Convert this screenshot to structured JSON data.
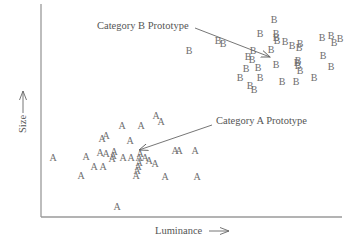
{
  "chart_data": {
    "type": "scatter",
    "title": "",
    "xlabel": "Luminance",
    "ylabel": "Size",
    "grid": false,
    "legend": null,
    "axes": {
      "x_ticks": [],
      "y_ticks": []
    },
    "series": [
      {
        "name": "Category A",
        "marker": "A",
        "points_px": [
          [
            156,
            115
          ],
          [
            161,
            121
          ],
          [
            122,
            125
          ],
          [
            141,
            125
          ],
          [
            102,
            138
          ],
          [
            106,
            135
          ],
          [
            130,
            140
          ],
          [
            53,
            157
          ],
          [
            86,
            156
          ],
          [
            94,
            166
          ],
          [
            103,
            166
          ],
          [
            100,
            152
          ],
          [
            106,
            153
          ],
          [
            113,
            155
          ],
          [
            114,
            151
          ],
          [
            112,
            158
          ],
          [
            123,
            157
          ],
          [
            131,
            157
          ],
          [
            139,
            157
          ],
          [
            140,
            153
          ],
          [
            145,
            157
          ],
          [
            149,
            160
          ],
          [
            155,
            163
          ],
          [
            138,
            166
          ],
          [
            137,
            170
          ],
          [
            136,
            175
          ],
          [
            165,
            176
          ],
          [
            175,
            150
          ],
          [
            195,
            150
          ],
          [
            197,
            176
          ],
          [
            117,
            206
          ],
          [
            81,
            175
          ],
          [
            179,
            150
          ],
          [
            139,
            162
          ]
        ]
      },
      {
        "name": "Category B",
        "marker": "B",
        "points_px": [
          [
            274,
            19
          ],
          [
            260,
            33
          ],
          [
            276,
            33
          ],
          [
            276,
            37
          ],
          [
            277,
            40
          ],
          [
            285,
            41
          ],
          [
            300,
            43
          ],
          [
            292,
            45
          ],
          [
            299,
            47
          ],
          [
            271,
            49
          ],
          [
            253,
            50
          ],
          [
            223,
            43
          ],
          [
            248,
            56
          ],
          [
            252,
            59
          ],
          [
            246,
            68
          ],
          [
            258,
            67
          ],
          [
            240,
            77
          ],
          [
            260,
            77
          ],
          [
            276,
            64
          ],
          [
            298,
            60
          ],
          [
            297,
            62
          ],
          [
            298,
            65
          ],
          [
            300,
            70
          ],
          [
            282,
            81
          ],
          [
            296,
            81
          ],
          [
            314,
            77
          ],
          [
            323,
            55
          ],
          [
            331,
            66
          ],
          [
            322,
            37
          ],
          [
            331,
            35
          ],
          [
            189,
            50
          ],
          [
            218,
            40
          ],
          [
            250,
            85
          ],
          [
            254,
            89
          ],
          [
            340,
            38
          ],
          [
            334,
            42
          ]
        ]
      }
    ],
    "annotations": [
      {
        "text": "Category B Prototype",
        "label_px": [
          97,
          25
        ],
        "arrow_from_px": [
          197,
          28
        ],
        "arrow_to_px": [
          270,
          57
        ]
      },
      {
        "text": "Category A Prototype",
        "label_px": [
          214,
          121
        ],
        "arrow_from_px": [
          212,
          124
        ],
        "arrow_to_px": [
          140,
          150
        ]
      }
    ]
  },
  "axes_px": {
    "x0": 41,
    "y0": 217,
    "x1": 342,
    "ytop": 4
  },
  "labels": {
    "x_axis": "Luminance",
    "y_axis": "Size",
    "annotation_b": "Category B Prototype",
    "annotation_a": "Category A Prototype"
  },
  "colors": {
    "axis": "#9a9a9a",
    "marker": "#6e6e6e",
    "text": "#555555",
    "arrow": "#666666"
  }
}
